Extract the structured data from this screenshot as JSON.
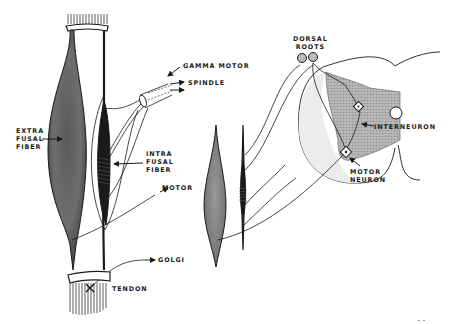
{
  "diagram": {
    "type": "anatomical illustration",
    "colors": {
      "ink": "#1a1a1a",
      "gray_fill": "#8a8a8a",
      "light_fill": "#cfcfcf",
      "background": "#ffffff"
    }
  },
  "labels": {
    "extrafusal": "EXTRA\nFUSAL\nFIBER",
    "intrafusal": "INTRA\nFUSAL\nFIBER",
    "gamma_motor": "GAMMA MOTOR",
    "spindle": "SPINDLE",
    "motor": "MOTOR",
    "golgi": "GOLGI",
    "tendon": "TENDON",
    "dorsal_roots": "DORSAL\nROOTS",
    "interneuron": "INTERNEURON",
    "motor_neuron": "MOTOR\nNEURON"
  }
}
